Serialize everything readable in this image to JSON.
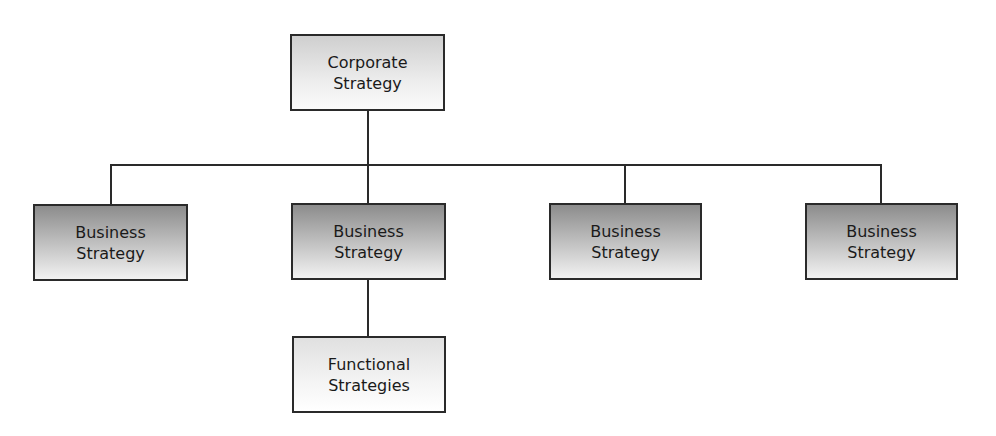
{
  "diagram": {
    "type": "hierarchy",
    "root": {
      "label": "Corporate\nStrategy",
      "children": [
        {
          "label": "Business\nStrategy",
          "children": []
        },
        {
          "label": "Business\nStrategy",
          "children": [
            {
              "label": "Functional\nStrategies",
              "children": []
            }
          ]
        },
        {
          "label": "Business\nStrategy",
          "children": []
        },
        {
          "label": "Business\nStrategy",
          "children": []
        }
      ]
    }
  },
  "colors": {
    "border": "#2a2a2a",
    "business_gradient_top": "#8c8c8c",
    "business_gradient_bottom": "#f2f2f2",
    "corporate_gradient_top": "#cfcfcf",
    "corporate_gradient_bottom": "#fbfbfb"
  }
}
